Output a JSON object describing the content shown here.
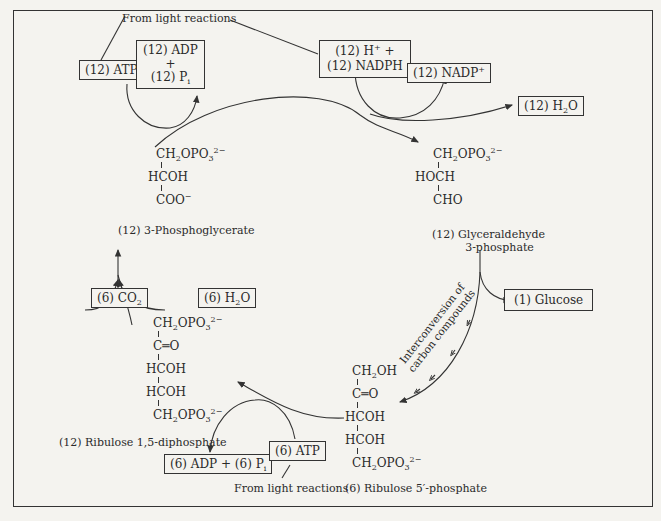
{
  "diagram": {
    "source_labels": {
      "from_light_top": "From light reactions",
      "from_light_bottom": "From light reactions"
    },
    "top_boxes": {
      "atp": "(12) ATP",
      "adp_line1": "(12) ADP",
      "adp_line2": "+",
      "adp_line3_prefix": "(12) P",
      "adp_line3_sub": "i",
      "nadph_line1_prefix": "(12) H",
      "nadph_line1_sup": "+",
      "nadph_line1_suffix": " +",
      "nadph_line2": "(12) NADPH",
      "nadp_prefix": "(12) NADP",
      "nadp_sup": "+",
      "h2o_prefix": "(12) H",
      "h2o_sub": "2",
      "h2o_suffix": "O"
    },
    "compounds": {
      "phosphoglycerate": {
        "name": "(12) 3-Phosphoglycerate",
        "row1_a": "CH",
        "row1_sub1": "2",
        "row1_b": "OPO",
        "row1_sub2": "3",
        "row1_sup": "2−",
        "row2": "HCOH",
        "row3_a": "COO",
        "row3_sup": "−"
      },
      "glyceraldehyde": {
        "name_line1": "(12) Glyceraldehyde",
        "name_line2": "3-phosphate",
        "row1_a": "CH",
        "row1_sub1": "2",
        "row1_b": "OPO",
        "row1_sub2": "3",
        "row1_sup": "2−",
        "row2": "HOCH",
        "row3": "CHO"
      },
      "ribulose_diphosphate": {
        "name": "(12) Ribulose 1,5-diphosphate",
        "row1_a": "CH",
        "row1_sub1": "2",
        "row1_b": "OPO",
        "row1_sub2": "3",
        "row1_sup": "2−",
        "row2": "C═O",
        "row3": "HCOH",
        "row4": "HCOH",
        "row5_a": "CH",
        "row5_sub1": "2",
        "row5_b": "OPO",
        "row5_sub2": "3",
        "row5_sup": "2−"
      },
      "ribulose_phosphate": {
        "name": "(6) Ribulose 5′-phosphate",
        "row1_a": "CH",
        "row1_sub1": "2",
        "row1_b": "OH",
        "row2": "C═O",
        "row3": "HCOH",
        "row4": "HCOH",
        "row5_a": "CH",
        "row5_sub1": "2",
        "row5_b": "OPO",
        "row5_sub2": "3",
        "row5_sup": "2−"
      }
    },
    "side_boxes": {
      "glucose": "(1) Glucose",
      "co2_prefix": "(6) CO",
      "co2_sub": "2",
      "h2o6_prefix": "(6) H",
      "h2o6_sub": "2",
      "h2o6_suffix": "O",
      "atp6": "(6) ATP",
      "adp6_prefix": "(6) ADP + (6) P",
      "adp6_sub": "i"
    },
    "interconversion_line1": "Interconversion of",
    "interconversion_line2": "carbon compounds"
  }
}
